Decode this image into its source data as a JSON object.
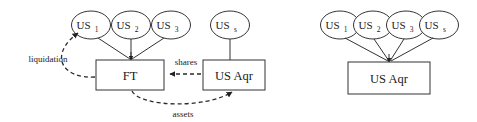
{
  "figure": {
    "background_color": "#ffffff",
    "stroke_color": "#333333",
    "text_color": "#1a1a1a"
  },
  "diagrams": [
    {
      "id": "before-acquisition",
      "nodes": {
        "shareholders": [
          {
            "id": "us1",
            "base": "US",
            "sub": "1"
          },
          {
            "id": "us2",
            "base": "US",
            "sub": "2"
          },
          {
            "id": "us3",
            "base": "US",
            "sub": "3"
          }
        ],
        "other_shareholder": {
          "id": "uss",
          "base": "US",
          "sub": "s"
        },
        "entity_ft": {
          "id": "ft",
          "label": "FT"
        },
        "entity_aqr": {
          "id": "usaqr",
          "label": "US Aqr"
        }
      },
      "edge_labels": {
        "liquidation": "liquidation",
        "shares": "shares",
        "assets": "assets"
      }
    },
    {
      "id": "after-acquisition",
      "nodes": {
        "shareholders": [
          {
            "id": "us1b",
            "base": "US",
            "sub": "1"
          },
          {
            "id": "us2b",
            "base": "US",
            "sub": "2"
          },
          {
            "id": "us3b",
            "base": "US",
            "sub": "3"
          },
          {
            "id": "ussb",
            "base": "US",
            "sub": "s"
          }
        ],
        "entity_aqr": {
          "id": "usaqr2",
          "label": "US Aqr"
        }
      }
    }
  ]
}
